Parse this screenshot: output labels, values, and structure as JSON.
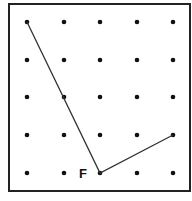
{
  "diagram": {
    "type": "geoboard",
    "grid": {
      "columns": 5,
      "rows": 5,
      "x_positions": [
        27,
        64,
        100,
        137,
        173
      ],
      "y_positions": [
        22,
        60,
        97,
        135,
        173
      ]
    },
    "border": {
      "x": 9,
      "y": 4,
      "width": 181,
      "height": 187,
      "color": "#222222"
    },
    "dot_color": "#111111",
    "line_color": "#333333",
    "path": [
      {
        "col": 0,
        "row": 0
      },
      {
        "col": 2,
        "row": 4
      },
      {
        "col": 4,
        "row": 3
      }
    ],
    "labels": [
      {
        "text": "F",
        "col": 2,
        "row": 4,
        "x": 79,
        "y": 167
      }
    ]
  }
}
